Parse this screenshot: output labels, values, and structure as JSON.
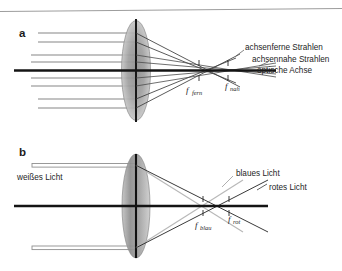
{
  "figure": {
    "title_rule": "top-horizontal-rule",
    "panels": [
      {
        "id": "a",
        "letter": "a",
        "topic": "spherical-aberration",
        "labels": {
          "marginal_rays": "achsenferne Strahlen",
          "paraxial_rays": "achsennahe Strahlen",
          "optical_axis": "optische Achse",
          "focus_far": {
            "symbol": "f",
            "subscript": "fern"
          },
          "focus_near": {
            "symbol": "f",
            "subscript": "nah"
          }
        }
      },
      {
        "id": "b",
        "letter": "b",
        "topic": "chromatic-aberration",
        "labels": {
          "incoming_light": "weißes Licht",
          "blue_light": "blaues Licht",
          "red_light": "rotes Licht",
          "focus_blue": {
            "symbol": "f",
            "subscript": "blau"
          },
          "focus_red": {
            "symbol": "f",
            "subscript": "rot"
          }
        }
      }
    ],
    "colors": {
      "background": "#ffffff",
      "axis": "#141414",
      "ray_thin": "#6e6e6e",
      "ray_dark": "#2b2b2b",
      "ray_light": "#b4b4b4",
      "lens_body": "#9a9a9a",
      "lens_edge": "#111111",
      "text": "#1d1d1d",
      "rule": "#9d9d9d"
    }
  }
}
